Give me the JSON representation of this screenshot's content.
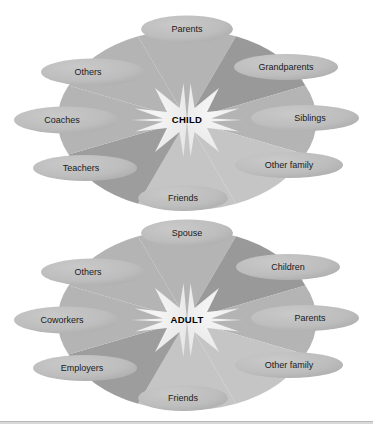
{
  "figure": {
    "type": "diagram",
    "divider_color": "#b8b8b8",
    "background": "#ffffff"
  },
  "palette": {
    "segment_dark": "#9a9a9a",
    "segment_mid": "#b0b0b0",
    "segment_light": "#c2c2c2",
    "segment_lighter": "#cccccc",
    "ellipse_fill": "#b9b9b9",
    "star_fill": "#efefef",
    "label_text": "#1a1a1a",
    "center_text": "#000000"
  },
  "diagrams": [
    {
      "id": "child",
      "center_label": "CHILD",
      "nodes": [
        {
          "label": "Parents",
          "position": "top",
          "segment_shade": "#b4b4b4"
        },
        {
          "label": "Grandparents",
          "position": "top-right",
          "segment_shade": "#9a9a9a"
        },
        {
          "label": "Siblings",
          "position": "right",
          "segment_shade": "#b4b4b4"
        },
        {
          "label": "Other family",
          "position": "bottom-right",
          "segment_shade": "#c4c4c4"
        },
        {
          "label": "Friends",
          "position": "bottom",
          "segment_shade": "#c4c4c4"
        },
        {
          "label": "Teachers",
          "position": "bottom-left",
          "segment_shade": "#9a9a9a"
        },
        {
          "label": "Coaches",
          "position": "left",
          "segment_shade": "#b4b4b4"
        },
        {
          "label": "Others",
          "position": "top-left",
          "segment_shade": "#b4b4b4"
        }
      ]
    },
    {
      "id": "adult",
      "center_label": "ADULT",
      "nodes": [
        {
          "label": "Spouse",
          "position": "top",
          "segment_shade": "#b4b4b4"
        },
        {
          "label": "Children",
          "position": "top-right",
          "segment_shade": "#9a9a9a"
        },
        {
          "label": "Parents",
          "position": "right",
          "segment_shade": "#b4b4b4"
        },
        {
          "label": "Other family",
          "position": "bottom-right",
          "segment_shade": "#c4c4c4"
        },
        {
          "label": "Friends",
          "position": "bottom",
          "segment_shade": "#c4c4c4"
        },
        {
          "label": "Employers",
          "position": "bottom-left",
          "segment_shade": "#9a9a9a"
        },
        {
          "label": "Coworkers",
          "position": "left",
          "segment_shade": "#b4b4b4"
        },
        {
          "label": "Others",
          "position": "top-left",
          "segment_shade": "#b4b4b4"
        }
      ]
    }
  ]
}
